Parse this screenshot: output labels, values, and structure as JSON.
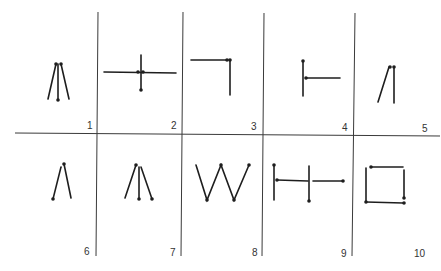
{
  "figure": {
    "title": "",
    "panels": [
      {
        "number": "1",
        "description": "three lines from top point: left leg, center leg with end dot, right leg"
      },
      {
        "number": "2",
        "description": "cross: horizontal line with vertical line, dots at intersection and bottom"
      },
      {
        "number": "3",
        "description": "horizontal line joined to vertical line at top-right corner"
      },
      {
        "number": "4",
        "description": "vertical line with horizontal branch to the right"
      },
      {
        "number": "5",
        "description": "two lines meeting at top"
      },
      {
        "number": "6",
        "description": "inverted V with dot at top and left base"
      },
      {
        "number": "7",
        "description": "three lines diverging from top point"
      },
      {
        "number": "8",
        "description": "W shape zigzag"
      },
      {
        "number": "9",
        "description": "two vertical lines connected by horizontal segments"
      },
      {
        "number": "10",
        "description": "square made of four line segments"
      }
    ]
  }
}
